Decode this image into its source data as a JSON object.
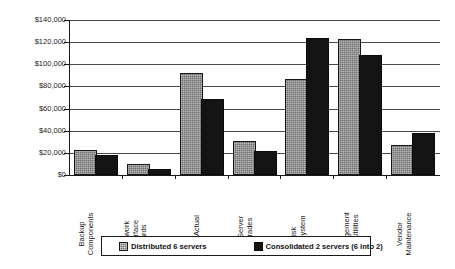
{
  "chart_data": {
    "type": "bar",
    "title": "",
    "xlabel": "",
    "ylabel": "",
    "ylim": [
      0,
      140000
    ],
    "ytick_labels": [
      "$140,000",
      "$120,000",
      "$100,000",
      "$80,000",
      "$60,000",
      "$40,000",
      "$20,000",
      "$0"
    ],
    "ytick_values": [
      140000,
      120000,
      100000,
      80000,
      60000,
      40000,
      20000,
      0
    ],
    "grid": true,
    "legend_position": "bottom",
    "categories": [
      "Backup Components",
      "Network Interface Cards",
      "NOS Actual",
      "File Server Upgrades",
      "Disk Subsystem",
      "Management and Utilities",
      "Vendor Maintenance"
    ],
    "category_lines": [
      [
        "Backup",
        "Components"
      ],
      [
        "Network",
        "Interface",
        "Cards"
      ],
      [
        "NOS Actual"
      ],
      [
        "File Server",
        "Upgrades"
      ],
      [
        "Disk",
        "Subsystem"
      ],
      [
        "Management",
        "and Utilities"
      ],
      [
        "Vendor",
        "Maintenance"
      ]
    ],
    "series": [
      {
        "name": "Distributed 6 servers",
        "color": "#6e6e6e",
        "values": [
          21000,
          8000,
          90000,
          29000,
          85000,
          121000,
          25000
        ]
      },
      {
        "name": "Consolidated 2 servers (6 into 2)",
        "color": "#141414",
        "values": [
          16000,
          3500,
          67000,
          20000,
          122000,
          107000,
          36000
        ]
      }
    ]
  },
  "legend": {
    "entries": [
      {
        "label": "Distributed 6 servers",
        "swatch": "hatched-gray-swatch"
      },
      {
        "label": "Consolidated 2 servers (6 into 2)",
        "swatch": "solid-black-swatch"
      }
    ]
  }
}
